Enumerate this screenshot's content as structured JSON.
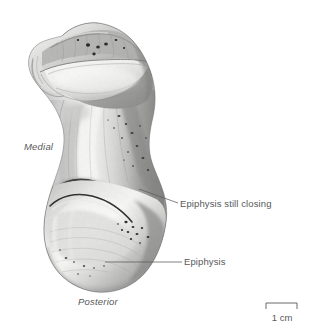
{
  "figure": {
    "type": "anatomical-illustration",
    "background_color": "#ffffff",
    "ink_color": "#58585a",
    "line_color": "#5a5a5c"
  },
  "annotations": [
    {
      "id": "epiphysis-still-closing",
      "text": "Epiphysis still closing",
      "leader": {
        "x1": 139,
        "y1": 189,
        "x2": 178,
        "y2": 203
      }
    },
    {
      "id": "epiphysis",
      "text": "Epiphysis",
      "leader": {
        "x1": 105,
        "y1": 262,
        "x2": 182,
        "y2": 262
      }
    }
  ],
  "orientation_labels": [
    {
      "id": "medial",
      "text": "Medial"
    },
    {
      "id": "posterior",
      "text": "Posterior"
    }
  ],
  "scale": {
    "label": "1 cm",
    "length_px": 31
  }
}
